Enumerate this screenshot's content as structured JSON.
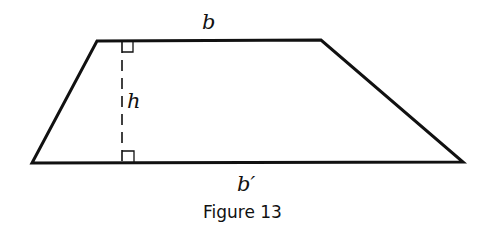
{
  "figure": {
    "caption": "Figure 13",
    "shape": "trapezoid",
    "labels": {
      "top_base": "b",
      "height": "h",
      "bottom_base": "b′"
    },
    "markers": [
      "right-angle-top",
      "right-angle-bottom"
    ],
    "colors": {
      "stroke": "#111111",
      "background": "#ffffff"
    }
  }
}
